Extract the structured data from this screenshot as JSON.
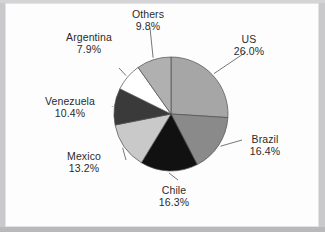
{
  "figure": {
    "background_color": "#fdfdfd",
    "surround_color": "#c9c9cb"
  },
  "chart_data": {
    "type": "pie",
    "title": "",
    "subtitle": "",
    "xlabel": "",
    "ylabel": "",
    "legend_position": "none",
    "labels_position": "outside-with-leader-lines",
    "start_angle_deg": 90,
    "direction": "clockwise",
    "grid": false,
    "units": "percent",
    "categories": [
      "US",
      "Brazil",
      "Chile",
      "Mexico",
      "Venezuela",
      "Argentina",
      "Others"
    ],
    "values": [
      26.0,
      16.4,
      16.3,
      13.2,
      10.4,
      7.9,
      9.8
    ],
    "slice_colors": [
      "#a6a6a6",
      "#8a8a8a",
      "#111111",
      "#c9c9c9",
      "#3a3a3a",
      "#ffffff",
      "#b0b0b0"
    ],
    "slices": [
      {
        "label": "US",
        "value": 26.0,
        "value_text": "26.0%",
        "color": "#a6a6a6"
      },
      {
        "label": "Brazil",
        "value": 16.4,
        "value_text": "16.4%",
        "color": "#8a8a8a"
      },
      {
        "label": "Chile",
        "value": 16.3,
        "value_text": "16.3%",
        "color": "#111111"
      },
      {
        "label": "Mexico",
        "value": 13.2,
        "value_text": "13.2%",
        "color": "#c9c9c9"
      },
      {
        "label": "Venezuela",
        "value": 10.4,
        "value_text": "10.4%",
        "color": "#3a3a3a"
      },
      {
        "label": "Argentina",
        "value": 7.9,
        "value_text": "7.9%",
        "color": "#ffffff"
      },
      {
        "label": "Others",
        "value": 9.8,
        "value_text": "9.8%",
        "color": "#b0b0b0"
      }
    ]
  }
}
